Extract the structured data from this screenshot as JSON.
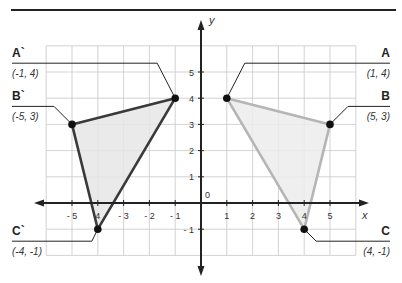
{
  "chart_data": {
    "type": "scatter",
    "title": "",
    "xlabel": "x",
    "ylabel": "y",
    "xlim": [
      -6,
      6
    ],
    "ylim": [
      -2,
      6
    ],
    "grid": true,
    "origin_label": "0",
    "x_ticks": [
      {
        "value": -5,
        "label": "- 5"
      },
      {
        "value": -4,
        "label": "4"
      },
      {
        "value": -3,
        "label": "- 3"
      },
      {
        "value": -2,
        "label": "- 2"
      },
      {
        "value": -1,
        "label": "- 1"
      },
      {
        "value": 1,
        "label": "1"
      },
      {
        "value": 2,
        "label": "2"
      },
      {
        "value": 3,
        "label": "3"
      },
      {
        "value": 4,
        "label": "4"
      },
      {
        "value": 5,
        "label": "5"
      }
    ],
    "y_ticks": [
      {
        "value": 5,
        "label": "5"
      },
      {
        "value": 4,
        "label": "4"
      },
      {
        "value": 3,
        "label": "3"
      },
      {
        "value": 2,
        "label": "2"
      },
      {
        "value": 1,
        "label": "1"
      },
      {
        "value": -1,
        "label": "- 1"
      }
    ],
    "series": [
      {
        "name": "reflected-triangle",
        "stroke": "#3a3a3a",
        "fill": "#e6e6e6",
        "points": [
          {
            "name": "A`",
            "coord_label": "(-1, 4)",
            "x": -1,
            "y": 4,
            "side": "left"
          },
          {
            "name": "B`",
            "coord_label": "(-5, 3)",
            "x": -5,
            "y": 3,
            "side": "left"
          },
          {
            "name": "C`",
            "coord_label": "(-4, -1)",
            "x": -4,
            "y": -1,
            "side": "left"
          }
        ]
      },
      {
        "name": "original-triangle",
        "stroke": "#b5b5b5",
        "fill": "#ececec",
        "points": [
          {
            "name": "A",
            "coord_label": "(1, 4)",
            "x": 1,
            "y": 4,
            "side": "right"
          },
          {
            "name": "B",
            "coord_label": "(5, 3)",
            "x": 5,
            "y": 3,
            "side": "right"
          },
          {
            "name": "C",
            "coord_label": "(4, -1)",
            "x": 4,
            "y": -1,
            "side": "right"
          }
        ]
      }
    ]
  }
}
